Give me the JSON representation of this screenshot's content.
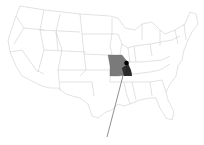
{
  "map": {
    "region": "United States",
    "highlighted_state": "Missouri",
    "colors": {
      "background": "#ffffff",
      "state_fill": "#ffffff",
      "state_border": "#b0b0b0",
      "highlight_fill": "#7a7a7a",
      "highlight_dark": "#2a2a2a",
      "marker": "#000000",
      "leader_line": "#444444"
    },
    "marker": {
      "label": ""
    }
  },
  "caption": {
    "text": ""
  }
}
